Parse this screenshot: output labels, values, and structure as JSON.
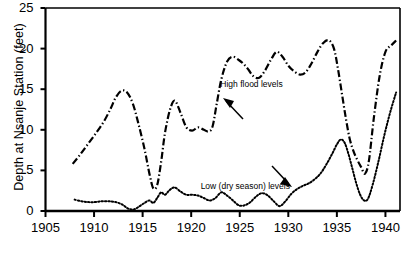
{
  "chart_data": {
    "type": "line",
    "title": "",
    "xlabel": "",
    "ylabel": "Depth at Nsanje Station (feet)",
    "xlim": [
      1905,
      1941.5
    ],
    "ylim": [
      0,
      25
    ],
    "grid": false,
    "legend_position": "none",
    "xticks": [
      1905,
      1910,
      1915,
      1920,
      1925,
      1930,
      1935,
      1940
    ],
    "yticks": [
      0,
      5,
      10,
      15,
      20,
      25
    ],
    "annotations": [
      {
        "name": "high-flood-levels",
        "text": "High flood levels",
        "x": 1923.0,
        "y": 15.5
      },
      {
        "name": "low-dry-season-levels",
        "text": "Low (dry season) levels",
        "x": 1928.8,
        "y": 3.0
      }
    ],
    "series": [
      {
        "name": "High flood levels",
        "style": "dash-dot",
        "x": [
          1907.8,
          1908.6,
          1909.4,
          1910.2,
          1911.0,
          1911.7,
          1912.2,
          1912.8,
          1913.4,
          1914.0,
          1914.6,
          1915.2,
          1915.7,
          1916.1,
          1916.5,
          1916.9,
          1917.3,
          1917.8,
          1918.3,
          1918.9,
          1919.5,
          1920.1,
          1920.7,
          1921.3,
          1921.8,
          1922.2,
          1922.6,
          1923.1,
          1923.7,
          1924.3,
          1924.9,
          1925.4,
          1925.9,
          1926.4,
          1927.0,
          1927.6,
          1928.2,
          1928.8,
          1929.4,
          1930.0,
          1930.6,
          1931.2,
          1931.8,
          1932.4,
          1933.0,
          1933.6,
          1934.2,
          1934.7,
          1935.1,
          1935.5,
          1935.9,
          1936.3,
          1936.7,
          1937.1,
          1937.5,
          1937.9,
          1938.3,
          1938.8,
          1939.4,
          1940.0,
          1940.6,
          1941.1
        ],
        "y": [
          5.8,
          7.0,
          8.3,
          9.6,
          11.0,
          12.6,
          13.9,
          14.8,
          14.6,
          13.2,
          10.6,
          7.6,
          4.6,
          2.8,
          3.2,
          6.0,
          9.6,
          12.4,
          13.6,
          12.1,
          10.3,
          9.9,
          10.3,
          10.0,
          9.8,
          10.4,
          13.0,
          16.2,
          18.4,
          19.0,
          18.6,
          18.1,
          17.4,
          16.6,
          16.4,
          17.3,
          18.6,
          19.6,
          19.0,
          17.9,
          17.2,
          16.8,
          17.1,
          18.2,
          19.6,
          20.7,
          21.0,
          20.0,
          17.6,
          14.6,
          11.6,
          9.0,
          7.4,
          6.3,
          5.4,
          4.6,
          6.2,
          11.4,
          16.6,
          19.6,
          20.4,
          21.0
        ]
      },
      {
        "name": "Low (dry season) levels",
        "style": "dotted",
        "x": [
          1908.0,
          1908.7,
          1909.4,
          1910.1,
          1910.8,
          1911.5,
          1912.2,
          1912.9,
          1913.5,
          1914.1,
          1914.7,
          1915.2,
          1915.7,
          1916.1,
          1916.5,
          1916.9,
          1917.3,
          1917.8,
          1918.3,
          1918.9,
          1919.5,
          1920.1,
          1920.7,
          1921.3,
          1921.9,
          1922.5,
          1923.1,
          1923.7,
          1924.3,
          1924.9,
          1925.5,
          1926.1,
          1926.7,
          1927.3,
          1927.9,
          1928.5,
          1929.1,
          1929.7,
          1930.3,
          1930.9,
          1931.5,
          1932.1,
          1932.7,
          1933.3,
          1933.9,
          1934.5,
          1935.0,
          1935.4,
          1935.8,
          1936.2,
          1936.6,
          1937.0,
          1937.4,
          1937.8,
          1938.2,
          1938.7,
          1939.3,
          1939.9,
          1940.5,
          1941.1
        ],
        "y": [
          1.4,
          1.2,
          1.1,
          1.1,
          1.2,
          1.2,
          1.1,
          0.8,
          0.3,
          0.2,
          0.6,
          1.0,
          1.3,
          1.0,
          1.6,
          2.3,
          2.0,
          2.6,
          2.9,
          2.4,
          2.0,
          2.0,
          1.9,
          1.6,
          1.3,
          1.6,
          2.3,
          1.9,
          1.3,
          0.7,
          0.7,
          1.1,
          1.8,
          2.2,
          1.9,
          1.2,
          0.6,
          1.2,
          2.1,
          2.7,
          3.1,
          3.4,
          3.9,
          4.6,
          5.7,
          7.0,
          8.2,
          8.8,
          8.4,
          7.0,
          5.2,
          3.4,
          2.0,
          1.3,
          1.5,
          3.3,
          6.2,
          9.4,
          12.2,
          14.6
        ]
      }
    ]
  },
  "axis": {
    "y_title": "Depth at Nsanje Station (feet)"
  }
}
